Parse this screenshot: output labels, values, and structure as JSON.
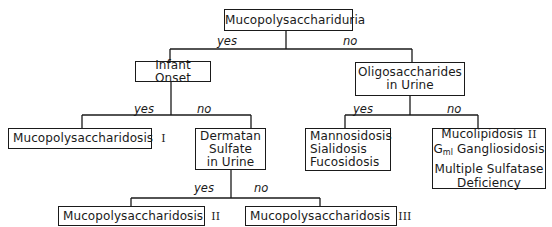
{
  "diagram": {
    "root": {
      "label": "Mucopolysacchariduria"
    },
    "edges_top": {
      "yes": "yes",
      "no": "no"
    },
    "infant_onset": {
      "label": "Infant Onset"
    },
    "oligo": {
      "line1": "Oligosaccharides",
      "line2": "in Urine"
    },
    "edges_infant": {
      "yes": "yes",
      "no": "no"
    },
    "edges_oligo": {
      "yes": "yes",
      "no": "no"
    },
    "mps1": {
      "label": "Mucopolysaccharidosis",
      "roman": "I"
    },
    "dermatan": {
      "line1": "Dermatan",
      "line2": "Sulfate",
      "line3": "in Urine"
    },
    "oligo_yes": {
      "line1": "Mannosidosis",
      "line2": "Sialidosis",
      "line3": "Fucosidosis"
    },
    "oligo_no": {
      "line1_text": "Mucolipidosis",
      "line1_roman": "II",
      "line2_g": "G",
      "line2_sub": "ml",
      "line2_text": "Gangliosidosis",
      "line3": "Multiple Sulfatase",
      "line4": "Deficiency"
    },
    "edges_dermatan": {
      "yes": "yes",
      "no": "no"
    },
    "mps2": {
      "label": "Mucopolysaccharidosis",
      "roman": "II"
    },
    "mps3": {
      "label": "Mucopolysaccharidosis",
      "roman": "III"
    }
  }
}
